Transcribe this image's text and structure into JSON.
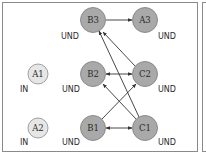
{
  "diagram": {
    "colors": {
      "node_dark_fill": "#a9a9a9",
      "node_dark_stroke": "#7a7a7a",
      "node_light_fill": "#e6e6e6",
      "node_light_stroke": "#8a8a8a",
      "edge": "#333333",
      "panel_border": "#8a8a8a"
    },
    "nodes": [
      {
        "id": "A1",
        "label": "A1",
        "state": "IN",
        "style": "light",
        "cx": 38,
        "cy": 74,
        "r": 10
      },
      {
        "id": "A2",
        "label": "A2",
        "state": "IN",
        "style": "light",
        "cx": 38,
        "cy": 128,
        "r": 10
      },
      {
        "id": "B3",
        "label": "B3",
        "state": "UND",
        "style": "dark",
        "cx": 93,
        "cy": 20,
        "r": 12.5
      },
      {
        "id": "A3",
        "label": "A3",
        "state": "UND",
        "style": "dark",
        "cx": 145,
        "cy": 20,
        "r": 12.5
      },
      {
        "id": "B2",
        "label": "B2",
        "state": "UND",
        "style": "dark",
        "cx": 93,
        "cy": 74,
        "r": 12.5
      },
      {
        "id": "C2",
        "label": "C2",
        "state": "UND",
        "style": "dark",
        "cx": 145,
        "cy": 74,
        "r": 12.5
      },
      {
        "id": "B1",
        "label": "B1",
        "state": "UND",
        "style": "dark",
        "cx": 93,
        "cy": 128,
        "r": 12.5
      },
      {
        "id": "C1",
        "label": "C1",
        "state": "UND",
        "style": "dark",
        "cx": 145,
        "cy": 128,
        "r": 12.5
      }
    ],
    "edges": [
      {
        "from": "B3",
        "to": "A3",
        "bidirectional": false
      },
      {
        "from": "B2",
        "to": "C2",
        "bidirectional": true
      },
      {
        "from": "B1",
        "to": "C1",
        "bidirectional": true
      },
      {
        "from": "C2",
        "to": "B3",
        "bidirectional": false
      },
      {
        "from": "C1",
        "to": "B3",
        "bidirectional": false
      },
      {
        "from": "C1",
        "to": "B2",
        "bidirectional": false
      },
      {
        "from": "B1",
        "to": "C2",
        "bidirectional": false
      }
    ],
    "labels": {
      "A1": "A1",
      "A2": "A2",
      "A3": "A3",
      "B1": "B1",
      "B2": "B2",
      "B3": "B3",
      "C1": "C1",
      "C2": "C2",
      "state_A1": "IN",
      "state_A2": "IN",
      "state_A3": "UND",
      "state_B1": "UND",
      "state_B2": "UND",
      "state_B3": "UND",
      "state_C1": "UND",
      "state_C2": "UND"
    }
  }
}
